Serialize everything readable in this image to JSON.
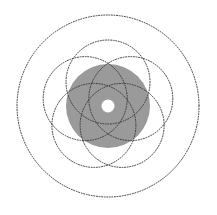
{
  "figure": {
    "type": "geometric-line-drawing",
    "canvas": {
      "width": 217,
      "height": 215,
      "background_color": "#ffffff"
    },
    "center": {
      "x": 108,
      "y": 106
    },
    "colors": {
      "stroke": "#3b3b3b",
      "fill_gray": "#9a9a9a",
      "background": "#ffffff",
      "hole": "#ffffff"
    },
    "stroke": {
      "width": 1.0,
      "style": "dotted",
      "dash_array": "1 1.6",
      "linecap": "round"
    },
    "outer_circle": {
      "label": "outer boundary circle",
      "cx": 108,
      "cy": 106,
      "r": 91,
      "filled": false
    },
    "gray_disc": {
      "label": "central filled disc",
      "cx": 108,
      "cy": 106,
      "r": 42,
      "fill": "#9a9a9a",
      "stroked": false
    },
    "center_hole": {
      "label": "white center hole",
      "cx": 108,
      "cy": 106,
      "r": 6.5,
      "fill": "#ffffff"
    },
    "petals": {
      "label": "rosette petal circles",
      "count": 5,
      "radius": 42,
      "orbit_radius": 24,
      "angle_step_deg": 72,
      "start_angle_deg": -90,
      "circles": [
        {
          "index": 1,
          "angle_deg": -90,
          "cx": 108,
          "cy": 82,
          "r": 42
        },
        {
          "index": 2,
          "angle_deg": -18,
          "cx": 130.8,
          "cy": 98.6,
          "r": 42
        },
        {
          "index": 3,
          "angle_deg": 54,
          "cx": 122.1,
          "cy": 125.4,
          "r": 42
        },
        {
          "index": 4,
          "angle_deg": 126,
          "cx": 93.9,
          "cy": 125.4,
          "r": 42
        },
        {
          "index": 5,
          "angle_deg": 198,
          "cx": 85.2,
          "cy": 98.6,
          "r": 42
        }
      ]
    }
  }
}
